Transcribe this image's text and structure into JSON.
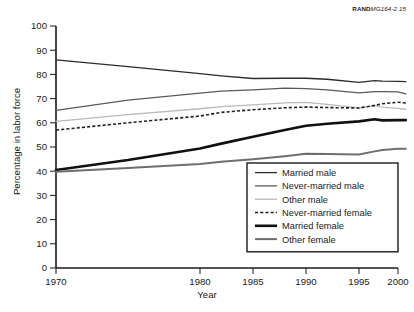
{
  "source_tag": {
    "org": "RAND",
    "doc_id": "MG164-2.15"
  },
  "chart_data": {
    "type": "line",
    "title": "",
    "xlabel": "Year",
    "ylabel": "Percentage in labor force",
    "ylim": [
      0,
      100
    ],
    "ytick_step": 10,
    "yticks": [
      0,
      10,
      20,
      30,
      40,
      50,
      60,
      70,
      80,
      90,
      100
    ],
    "xticks": [
      1970,
      1980,
      1985,
      1990,
      1995,
      2000
    ],
    "xtick_labels": [
      "1970",
      "1980",
      "1985",
      "1990",
      "1995",
      "2000"
    ],
    "grid": false,
    "legend_position": "lower-right-inside",
    "x": [
      1970,
      1975,
      1980,
      1982,
      1985,
      1988,
      1990,
      1992,
      1995,
      1997,
      1998,
      2000,
      2001
    ],
    "series": [
      {
        "name": "Married male",
        "style": "solid",
        "width": 1.3,
        "color": "#2b2b2b",
        "values": [
          86.0,
          83.2,
          80.3,
          79.4,
          78.3,
          78.4,
          78.4,
          78.0,
          76.7,
          77.4,
          77.2,
          77.1,
          77.0
        ]
      },
      {
        "name": "Never-married male",
        "style": "solid",
        "width": 1.3,
        "color": "#5a5a5a",
        "values": [
          65.1,
          69.4,
          72.3,
          73.1,
          73.6,
          74.3,
          74.1,
          73.6,
          72.4,
          72.9,
          72.9,
          72.8,
          72.0
        ]
      },
      {
        "name": "Other male",
        "style": "solid",
        "width": 1.3,
        "color": "#b9b9b9",
        "values": [
          60.6,
          63.4,
          65.8,
          66.7,
          67.4,
          68.2,
          68.4,
          67.6,
          66.2,
          67.1,
          66.5,
          66.0,
          65.6
        ]
      },
      {
        "name": "Never-married female",
        "style": "dashed",
        "width": 1.6,
        "color": "#1f1f1f",
        "values": [
          57.0,
          60.0,
          62.8,
          64.3,
          65.4,
          66.2,
          66.5,
          66.3,
          66.1,
          67.2,
          67.9,
          68.5,
          68.2
        ]
      },
      {
        "name": "Married female",
        "style": "solid",
        "width": 2.6,
        "color": "#101010",
        "values": [
          40.5,
          44.6,
          49.4,
          51.4,
          54.2,
          57.0,
          58.8,
          59.6,
          60.6,
          61.5,
          61.0,
          61.1,
          61.1
        ]
      },
      {
        "name": "Other female",
        "style": "solid",
        "width": 2.0,
        "color": "#6e6e6e",
        "values": [
          39.8,
          41.3,
          43.0,
          43.9,
          44.9,
          46.2,
          47.2,
          47.1,
          46.9,
          48.2,
          48.8,
          49.3,
          49.3
        ]
      }
    ]
  }
}
